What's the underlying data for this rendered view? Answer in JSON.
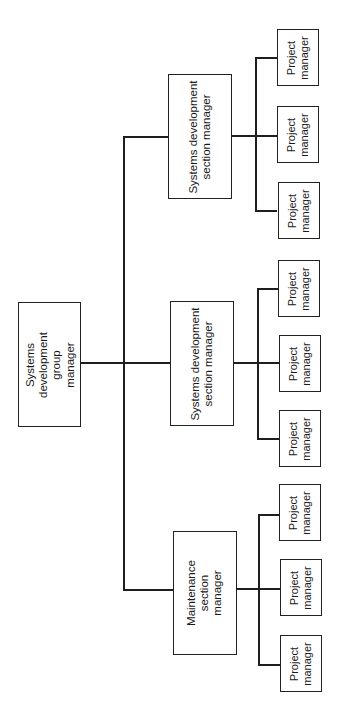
{
  "diagram": {
    "type": "org-chart",
    "orientation": "rotated-90-ccw",
    "root": {
      "label": "Systems\ndevelopment\ngroup\nmanager"
    },
    "sections": [
      {
        "label": "Systems development\nsection manager",
        "children": [
          "Project\nmanager",
          "Project\nmanager",
          "Project\nmanager"
        ]
      },
      {
        "label": "Systems development\nsection manager",
        "children": [
          "Project\nmanager",
          "Project\nmanager",
          "Project\nmanager"
        ]
      },
      {
        "label": "Maintenance\nsection\nmanager",
        "children": [
          "Project\nmanager",
          "Project\nmanager",
          "Project\nmanager"
        ]
      }
    ],
    "colors": {
      "line": "#1e1e1e",
      "box_border": "#222222",
      "background": "#ffffff"
    }
  }
}
